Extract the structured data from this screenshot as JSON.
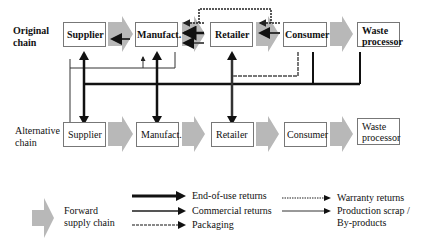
{
  "diagram": {
    "original_chain": {
      "label_line1": "Original",
      "label_line2": "chain",
      "nodes": [
        "Supplier",
        "Manufact.",
        "Retailer",
        "Consumer",
        "Waste processor"
      ]
    },
    "alternative_chain": {
      "label_line1": "Alternative",
      "label_line2": "chain",
      "nodes": [
        "Supplier",
        "Manufact.",
        "Retailer",
        "Consumer",
        "Waste processor"
      ]
    },
    "waste_line1": "Waste",
    "waste_line2": "processor"
  },
  "legend": {
    "forward_line1": "Forward",
    "forward_line2": "supply chain",
    "end_of_use": "End-of-use returns",
    "commercial": "Commercial returns",
    "packaging": "Packaging",
    "warranty": "Warranty returns",
    "scrap_line1": "Production scrap /",
    "scrap_line2": "By-products"
  },
  "colors": {
    "forward_arrow": "#b8b8b8",
    "end_of_use": "#111111",
    "commercial": "#555555",
    "packaging": "#888888"
  }
}
